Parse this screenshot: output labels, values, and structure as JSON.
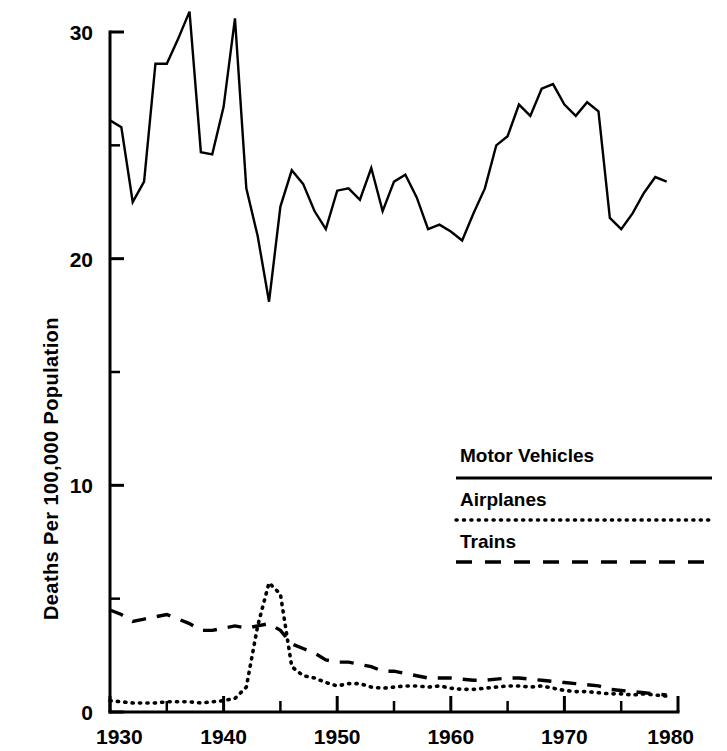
{
  "chart_data": {
    "type": "line",
    "title": "",
    "xlabel": "",
    "ylabel": "Deaths Per 100,000 Population",
    "xlim": [
      1930,
      1980
    ],
    "ylim": [
      0,
      30
    ],
    "grid": false,
    "legend_position": "center-right",
    "y_ticks": [
      0,
      10,
      20,
      30
    ],
    "y_tick_labels": [
      "0",
      "10",
      "20",
      "30"
    ],
    "y_minor_ticks": [
      5,
      15,
      25
    ],
    "x_ticks": [
      1930,
      1940,
      1950,
      1960,
      1970,
      1980
    ],
    "x_tick_labels": [
      "1930",
      "1940",
      "1950",
      "1960",
      "1970",
      "1980"
    ],
    "x_minor_ticks": [
      1935,
      1945,
      1955,
      1965,
      1975
    ],
    "x": [
      1930,
      1931,
      1932,
      1933,
      1934,
      1935,
      1936,
      1937,
      1938,
      1939,
      1940,
      1941,
      1942,
      1943,
      1944,
      1945,
      1946,
      1947,
      1948,
      1949,
      1950,
      1951,
      1952,
      1953,
      1954,
      1955,
      1956,
      1957,
      1958,
      1959,
      1960,
      1961,
      1962,
      1963,
      1964,
      1965,
      1966,
      1967,
      1968,
      1969,
      1970,
      1971,
      1972,
      1973,
      1974,
      1975,
      1976,
      1977,
      1978,
      1979
    ],
    "series": [
      {
        "name": "Motor Vehicles",
        "style": "solid",
        "color": "#000000",
        "values": [
          26.1,
          25.8,
          22.5,
          23.4,
          28.6,
          28.6,
          29.7,
          30.9,
          24.7,
          24.6,
          26.7,
          30.6,
          23.1,
          21.0,
          18.1,
          22.3,
          23.9,
          23.3,
          22.1,
          21.3,
          23.0,
          23.1,
          22.6,
          24.0,
          22.1,
          23.4,
          23.7,
          22.7,
          21.3,
          21.5,
          21.2,
          20.8,
          22.0,
          23.1,
          25.0,
          25.4,
          26.8,
          26.3,
          27.5,
          27.7,
          26.8,
          26.3,
          26.9,
          26.5,
          21.8,
          21.3,
          22.0,
          22.9,
          23.6,
          23.4
        ]
      },
      {
        "name": "Airplanes",
        "style": "dotted",
        "color": "#000000",
        "values": [
          0.5,
          0.45,
          0.4,
          0.4,
          0.4,
          0.45,
          0.45,
          0.45,
          0.4,
          0.45,
          0.5,
          0.6,
          1.1,
          3.8,
          5.7,
          5.2,
          2.0,
          1.6,
          1.5,
          1.3,
          1.15,
          1.25,
          1.25,
          1.1,
          1.05,
          1.1,
          1.15,
          1.15,
          1.1,
          1.15,
          1.05,
          1.0,
          1.0,
          1.05,
          1.1,
          1.15,
          1.15,
          1.1,
          1.15,
          1.05,
          0.95,
          0.9,
          0.9,
          0.85,
          0.8,
          0.8,
          0.75,
          0.8,
          0.75,
          0.7
        ]
      },
      {
        "name": "Trains",
        "style": "dashed",
        "color": "#000000",
        "values": [
          4.5,
          4.3,
          4.0,
          4.1,
          4.2,
          4.3,
          4.1,
          3.9,
          3.6,
          3.6,
          3.7,
          3.8,
          3.7,
          3.8,
          3.9,
          3.6,
          3.0,
          2.8,
          2.6,
          2.3,
          2.2,
          2.2,
          2.1,
          2.0,
          1.8,
          1.8,
          1.7,
          1.6,
          1.5,
          1.5,
          1.5,
          1.45,
          1.4,
          1.4,
          1.45,
          1.5,
          1.5,
          1.45,
          1.4,
          1.35,
          1.3,
          1.25,
          1.2,
          1.15,
          1.0,
          0.95,
          0.9,
          0.85,
          0.8,
          0.75
        ]
      }
    ],
    "legend": [
      {
        "label": "Motor Vehicles",
        "style": "solid"
      },
      {
        "label": "Airplanes",
        "style": "dotted"
      },
      {
        "label": "Trains",
        "style": "dashed"
      }
    ]
  }
}
